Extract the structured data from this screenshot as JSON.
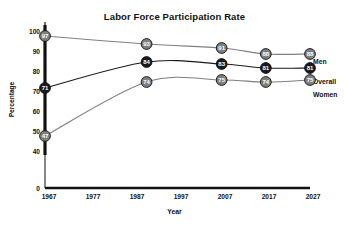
{
  "chart_data": {
    "type": "line",
    "title": "Labor Force Participation Rate",
    "xlabel": "Year",
    "ylabel": "Percentage",
    "x": [
      1967,
      1990,
      2007,
      2017,
      2027
    ],
    "xticks": [
      "1967",
      "1977",
      "1987",
      "1997",
      "2007",
      "2017",
      "2027"
    ],
    "yticks": [
      "100",
      "90",
      "80",
      "70",
      "60",
      "50",
      "40",
      "0"
    ],
    "xlim": [
      1967,
      2027
    ],
    "ylim": [
      40,
      100
    ],
    "grid": false,
    "legend_position": "right",
    "axis_break": true,
    "series": [
      {
        "name": "Men",
        "color": "#7f7f7f",
        "marker_fill": "#7f7f7f",
        "values": [
          97,
          93,
          91,
          88,
          88
        ],
        "labels": [
          "97",
          "93",
          "91",
          "88",
          "88"
        ]
      },
      {
        "name": "Overall",
        "color": "#1a1a1a",
        "marker_fill": "#1a1a1a",
        "values": [
          71,
          84,
          83,
          81,
          81
        ],
        "labels": [
          "71",
          "84",
          "83",
          "81",
          "81"
        ]
      },
      {
        "name": "Women",
        "color": "#7f7f7f",
        "marker_fill": "#7f7f7f",
        "values": [
          47,
          74,
          75,
          74,
          75
        ],
        "labels": [
          "47",
          "74",
          "75",
          "74",
          "75"
        ]
      }
    ]
  },
  "legend": {
    "men": "Men",
    "overall": "Overall",
    "women": "Women"
  },
  "axis": {
    "y_labels": {
      "t100": "100",
      "t90": "90",
      "t80": "80",
      "t70": "70",
      "t60": "60",
      "t50": "50",
      "t40": "40",
      "t0": "0"
    },
    "x_labels": {
      "t1967": "1967",
      "t1977": "1977",
      "t1987": "1987",
      "t1997": "1997",
      "t2007": "2007",
      "t2017": "2017",
      "t2027": "2027"
    }
  },
  "colors": {
    "men_line": "#7f7f7f",
    "overall_line": "#1a1a1a",
    "women_line": "#7f7f7f",
    "axis": "#111111",
    "background": "#ffffff"
  }
}
